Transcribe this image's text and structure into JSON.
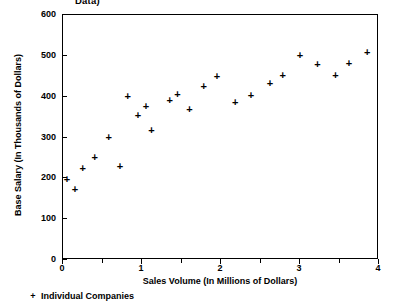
{
  "chart_data": {
    "type": "scatter",
    "title": "Data)",
    "xlabel": "Sales Volume (In Millions of Dollars)",
    "ylabel": "Base Salary (In Thousands of Dollars)",
    "xlim": [
      0,
      4
    ],
    "ylim": [
      0,
      600
    ],
    "xticks": [
      0,
      1,
      2,
      3,
      4
    ],
    "xtick_labels": [
      "0",
      "1",
      "2",
      "3",
      "4"
    ],
    "xminor_ticks": [
      0.5,
      1.5,
      2.5,
      3.5
    ],
    "yticks": [
      0,
      100,
      200,
      300,
      400,
      500,
      600
    ],
    "ytick_labels": [
      "0",
      "100",
      "200",
      "300",
      "400",
      "500",
      "600"
    ],
    "grid": false,
    "legend_position": "below-axes-left",
    "series": [
      {
        "name": "Individual Companies",
        "marker": "plus",
        "color": "#000000",
        "points": [
          {
            "x": 0.05,
            "y": 198
          },
          {
            "x": 0.15,
            "y": 172
          },
          {
            "x": 0.25,
            "y": 225
          },
          {
            "x": 0.4,
            "y": 250
          },
          {
            "x": 0.58,
            "y": 300
          },
          {
            "x": 0.72,
            "y": 228
          },
          {
            "x": 0.82,
            "y": 400
          },
          {
            "x": 0.95,
            "y": 355
          },
          {
            "x": 1.05,
            "y": 375
          },
          {
            "x": 1.12,
            "y": 318
          },
          {
            "x": 1.35,
            "y": 390
          },
          {
            "x": 1.45,
            "y": 405
          },
          {
            "x": 1.6,
            "y": 368
          },
          {
            "x": 1.78,
            "y": 425
          },
          {
            "x": 1.95,
            "y": 450
          },
          {
            "x": 2.18,
            "y": 385
          },
          {
            "x": 2.38,
            "y": 402
          },
          {
            "x": 2.62,
            "y": 432
          },
          {
            "x": 2.78,
            "y": 452
          },
          {
            "x": 3.0,
            "y": 502
          },
          {
            "x": 3.22,
            "y": 478
          },
          {
            "x": 3.45,
            "y": 452
          },
          {
            "x": 3.62,
            "y": 482
          },
          {
            "x": 3.85,
            "y": 508
          }
        ]
      }
    ]
  },
  "legend": {
    "marker": "+",
    "label": "Individual Companies"
  }
}
